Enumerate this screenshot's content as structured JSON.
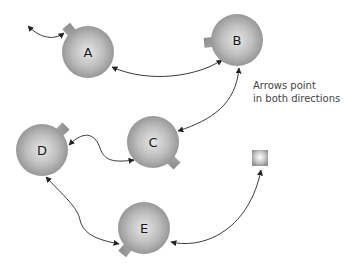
{
  "diagram": {
    "type": "network",
    "nodes": [
      {
        "id": "A",
        "label": "A",
        "cx": 88,
        "cy": 52,
        "r": 26,
        "nub_angle": -130
      },
      {
        "id": "B",
        "label": "B",
        "cx": 237,
        "cy": 40,
        "r": 26,
        "nub_angle": 175
      },
      {
        "id": "C",
        "label": "C",
        "cx": 153,
        "cy": 142,
        "r": 26,
        "nub_angle": 45
      },
      {
        "id": "D",
        "label": "D",
        "cx": 42,
        "cy": 150,
        "r": 26,
        "nub_angle": -45
      },
      {
        "id": "E",
        "label": "E",
        "cx": 144,
        "cy": 228,
        "r": 26,
        "nub_angle": 130
      }
    ],
    "square": {
      "id": "square",
      "x": 252,
      "y": 150,
      "size": 16
    },
    "edges": [
      {
        "from": "A",
        "to": "offscreen-top-left",
        "bidirectional": true
      },
      {
        "from": "A",
        "to": "B",
        "bidirectional": true
      },
      {
        "from": "B",
        "to": "C",
        "bidirectional": true
      },
      {
        "from": "C",
        "to": "D",
        "bidirectional": true
      },
      {
        "from": "D",
        "to": "E",
        "bidirectional": true
      },
      {
        "from": "E",
        "to": "square",
        "bidirectional": true
      }
    ],
    "note": {
      "line1": "Arrows point",
      "line2": "in both directions"
    },
    "colors": {
      "node_edge": "#8f8f8f",
      "node_center": "#e8e8e8",
      "edge_stroke": "#333333",
      "text": "#1a1a1a",
      "note_text": "#444444"
    }
  }
}
